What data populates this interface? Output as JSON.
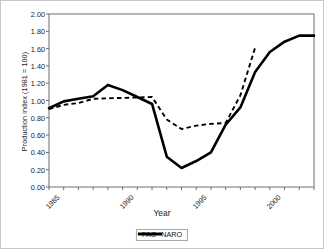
{
  "chart_data": {
    "type": "line",
    "title": "",
    "xlabel": "Year",
    "ylabel": "Production index (1981 = 100)",
    "xlim": [
      1985,
      2003
    ],
    "ylim": [
      0.0,
      2.0
    ],
    "ytick_labels": [
      "2.00",
      "1.80",
      "1.60",
      "1.40",
      "1.20",
      "1.00",
      "0.80",
      "0.60",
      "0.40",
      "0.20",
      "0.00"
    ],
    "ytick_values": [
      2.0,
      1.8,
      1.6,
      1.4,
      1.2,
      1.0,
      0.8,
      0.6,
      0.4,
      0.2,
      0.0
    ],
    "xtick_labels": [
      "1985",
      "1990",
      "1995",
      "2000"
    ],
    "xtick_values": [
      1985,
      1990,
      1995,
      2000
    ],
    "x_minor_ticks": [
      1985,
      1986,
      1987,
      1988,
      1989,
      1990,
      1991,
      1992,
      1993,
      1994,
      1995,
      1996,
      1997,
      1998,
      1999,
      2000,
      2001,
      2002,
      2003
    ],
    "grid": false,
    "legend_position": "bottom-center",
    "series": [
      {
        "name": "FAO",
        "style": "dashed",
        "color": "#000000",
        "x": [
          1985,
          1986,
          1987,
          1988,
          1992,
          1993,
          1994,
          1995,
          1996,
          1997,
          1998,
          1999
        ],
        "values": [
          0.9,
          0.95,
          0.97,
          1.02,
          1.04,
          0.78,
          0.67,
          0.71,
          0.73,
          0.74,
          1.06,
          1.61
        ]
      },
      {
        "name": "NARO",
        "style": "solid",
        "color": "#000000",
        "x": [
          1985,
          1986,
          1987,
          1988,
          1989,
          1990,
          1991,
          1992,
          1993,
          1994,
          1995,
          1996,
          1997,
          1998,
          1999,
          2000,
          2001,
          2002,
          2003
        ],
        "values": [
          0.91,
          0.99,
          1.02,
          1.05,
          1.18,
          1.12,
          1.04,
          0.96,
          0.35,
          0.22,
          0.3,
          0.4,
          0.72,
          0.92,
          1.33,
          1.56,
          1.68,
          1.75,
          1.75
        ]
      }
    ]
  },
  "legend": {
    "items": [
      {
        "label": "FAO"
      },
      {
        "label": "NARO"
      }
    ]
  }
}
